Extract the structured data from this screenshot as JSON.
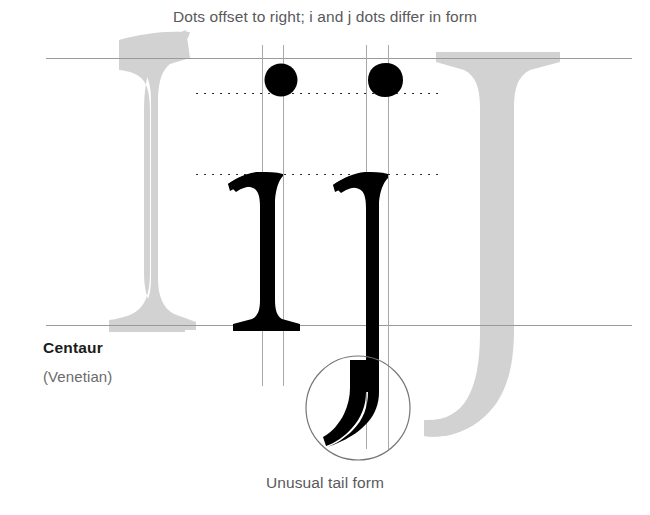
{
  "figure": {
    "caption_top": "Dots offset to right; i and j dots differ in form",
    "caption_bottom": "Unusual tail form",
    "typeface_name": "Centaur",
    "typeface_classification": "(Venetian)",
    "sample_letters": "ij",
    "colors": {
      "background": "#ffffff",
      "ink_glyph": "#000000",
      "ghost_glyph": "#d2d2d2",
      "caption_text": "#59595b",
      "label_name_text": "#1b1b1b",
      "label_class_text": "#6b6b6d",
      "guide_solid": "#9a9a9c",
      "guide_vertical": "#a9a9ab",
      "guide_dotted": "#2a2a2a",
      "callout_ring": "#76767a"
    }
  },
  "guides": {
    "horizontal": [
      {
        "name": "cap-height-line",
        "style": "solid",
        "y": 58,
        "x1": 46,
        "x2": 632
      },
      {
        "name": "ascender-dot-line",
        "style": "dotted",
        "y": 93,
        "x1": 196,
        "x2": 441
      },
      {
        "name": "x-height-line",
        "style": "dotted",
        "y": 174,
        "x1": 196,
        "x2": 441
      },
      {
        "name": "baseline",
        "style": "solid",
        "y": 325,
        "x1": 46,
        "x2": 632
      }
    ],
    "vertical": [
      {
        "name": "i-stem-left-line",
        "x": 262,
        "y1": 45,
        "y2": 386
      },
      {
        "name": "i-dot-center-line",
        "x": 283,
        "y1": 45,
        "y2": 386
      },
      {
        "name": "j-stem-left-line",
        "x": 366,
        "y1": 45,
        "y2": 449
      },
      {
        "name": "j-dot-center-line",
        "x": 388,
        "y1": 45,
        "y2": 449
      }
    ]
  },
  "annotations": {
    "tail_callout": {
      "name": "tail-callout-circle",
      "cx": 358,
      "cy": 408,
      "r": 52
    }
  }
}
